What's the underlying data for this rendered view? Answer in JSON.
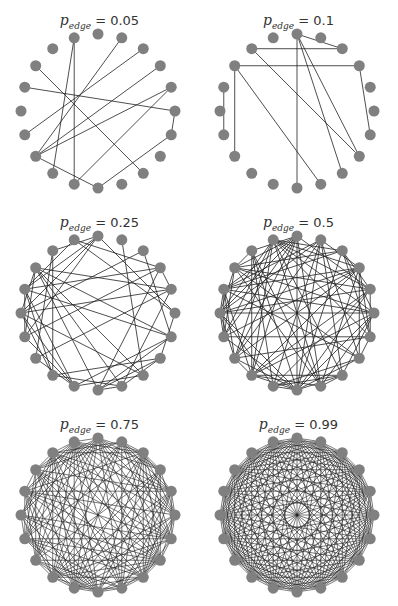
{
  "figure": {
    "node_count": 20,
    "node_color": "#808080",
    "edge_color": "#222222",
    "panels": [
      {
        "title_symbol": "p",
        "title_sub": "edge",
        "title_value": "= 0.05",
        "p_edge": 0.05,
        "edges": [
          [
            1,
            13
          ],
          [
            2,
            14
          ],
          [
            4,
            13
          ],
          [
            4,
            11
          ],
          [
            3,
            13
          ],
          [
            5,
            6
          ],
          [
            5,
            16
          ],
          [
            6,
            10
          ],
          [
            8,
            17
          ],
          [
            10,
            13
          ],
          [
            11,
            19
          ],
          [
            12,
            19
          ]
        ]
      },
      {
        "title_symbol": "p",
        "title_sub": "edge",
        "title_value": "= 0.1",
        "p_edge": 0.1
      },
      {
        "title_symbol": "p",
        "title_sub": "edge",
        "title_value": "= 0.25",
        "p_edge": 0.25
      },
      {
        "title_symbol": "p",
        "title_sub": "edge",
        "title_value": "= 0.5",
        "p_edge": 0.5
      },
      {
        "title_symbol": "p",
        "title_sub": "edge",
        "title_value": "= 0.75",
        "p_edge": 0.75
      },
      {
        "title_symbol": "p",
        "title_sub": "edge",
        "title_value": "= 0.99",
        "p_edge": 0.99
      }
    ]
  }
}
